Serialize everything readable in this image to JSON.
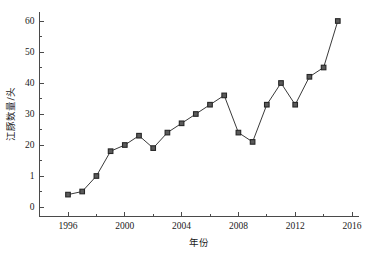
{
  "chart_data": {
    "type": "line",
    "title": "",
    "subtitle": "",
    "xlabel": "年份",
    "ylabel": "江豚数量/头",
    "x": [
      1996,
      1997,
      1998,
      1999,
      2000,
      2001,
      2002,
      2003,
      2004,
      2005,
      2006,
      2007,
      2008,
      2009,
      2010,
      2011,
      2012,
      2013,
      2014,
      2015
    ],
    "values": [
      4,
      5,
      10,
      18,
      20,
      23,
      19,
      24,
      27,
      30,
      33,
      36,
      24,
      21,
      33,
      40,
      33,
      42,
      45,
      60
    ],
    "series": [
      {
        "name": "江豚数量/头",
        "values": [
          4,
          5,
          10,
          18,
          20,
          23,
          19,
          24,
          27,
          30,
          33,
          36,
          24,
          21,
          33,
          40,
          33,
          42,
          45,
          60
        ]
      }
    ],
    "xlim": [
      1994,
      2016.5
    ],
    "ylim": [
      -3,
      63
    ],
    "xticks": [
      1996,
      1998,
      2000,
      2002,
      2004,
      2006,
      2008,
      2010,
      2012,
      2014,
      2016
    ],
    "xtick_labels": [
      "1996",
      "",
      "2000",
      "",
      "2004",
      "",
      "2008",
      "",
      "2012",
      "",
      "2016"
    ],
    "yticks": [
      0,
      5,
      10,
      15,
      20,
      25,
      30,
      35,
      40,
      45,
      50,
      55,
      60
    ],
    "ytick_labels": [
      "0",
      "",
      "1",
      "",
      "20",
      "",
      "30",
      "",
      "40",
      "",
      "50",
      "",
      "60"
    ],
    "grid": false,
    "legend": "none",
    "marker": "square",
    "line_color": "#3a3a3a",
    "marker_fill": "#5a5a5a",
    "marker_edge": "#262626",
    "axis_color": "#4a4a4a",
    "background": "#ffffff"
  }
}
